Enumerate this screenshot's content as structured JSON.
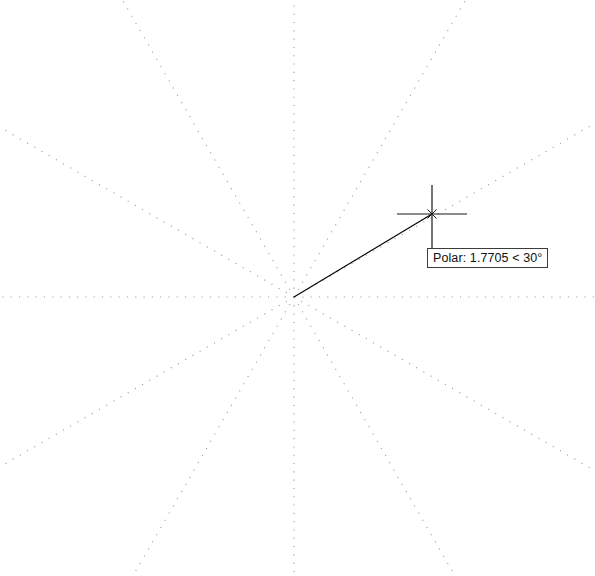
{
  "app": {
    "name": "CAD Drawing Area",
    "mode": "Polar Tracking"
  },
  "canvas": {
    "background_color": "#ffffff",
    "width": 595,
    "height": 576
  },
  "polar_tracking": {
    "origin_label": "rubber-band-origin",
    "origin_x": 294,
    "origin_y": 297,
    "ray_color": "#9a9aa2",
    "ray_angles_deg": [
      0,
      30,
      60,
      90,
      120,
      150,
      180,
      210,
      240,
      270,
      300,
      330
    ],
    "ray_increment_deg": 30,
    "ray_style": "dotted"
  },
  "rubber_band": {
    "color": "#000000",
    "start_x": 294,
    "start_y": 297,
    "end_x": 432,
    "end_y": 214
  },
  "cursor": {
    "name": "crosshair-cursor",
    "color": "#1a1a1a",
    "center_x": 432,
    "center_y": 214,
    "h_arm_left": 397,
    "h_arm_right": 467,
    "v_arm_top": 185,
    "v_arm_bottom": 248,
    "pickbox_size": 9
  },
  "tooltip": {
    "name": "polar-tooltip",
    "text": "Polar: 1.7705 < 30°",
    "prefix": "Polar:",
    "distance": "1.7705",
    "separator": "<",
    "angle": "30°",
    "border_color": "#3c3c3c",
    "background_color": "#ffffff",
    "text_color": "#101010"
  }
}
